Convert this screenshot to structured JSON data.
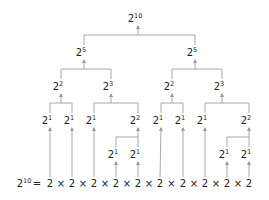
{
  "diagram": {
    "colors": {
      "text": "#222222",
      "line": "#a8a8a8",
      "arrow": "#9a9a9a",
      "background": "#ffffff"
    },
    "nodes": [
      {
        "id": "n0",
        "base": "2",
        "exp": "10",
        "x": 138,
        "y": 22
      },
      {
        "id": "n1",
        "base": "2",
        "exp": "5",
        "x": 84,
        "y": 56
      },
      {
        "id": "n2",
        "base": "2",
        "exp": "5",
        "x": 195,
        "y": 56
      },
      {
        "id": "n3",
        "base": "2",
        "exp": "2",
        "x": 61,
        "y": 90
      },
      {
        "id": "n4",
        "base": "2",
        "exp": "3",
        "x": 111,
        "y": 90
      },
      {
        "id": "n5",
        "base": "2",
        "exp": "2",
        "x": 172,
        "y": 90
      },
      {
        "id": "n6",
        "base": "2",
        "exp": "3",
        "x": 222,
        "y": 90
      },
      {
        "id": "n7",
        "base": "2",
        "exp": "1",
        "x": 50,
        "y": 124
      },
      {
        "id": "n8",
        "base": "2",
        "exp": "1",
        "x": 72,
        "y": 124
      },
      {
        "id": "n9",
        "base": "2",
        "exp": "1",
        "x": 94,
        "y": 124
      },
      {
        "id": "n10",
        "base": "2",
        "exp": "2",
        "x": 138,
        "y": 124
      },
      {
        "id": "n11",
        "base": "2",
        "exp": "1",
        "x": 161,
        "y": 124
      },
      {
        "id": "n12",
        "base": "2",
        "exp": "1",
        "x": 183,
        "y": 124
      },
      {
        "id": "n13",
        "base": "2",
        "exp": "1",
        "x": 205,
        "y": 124
      },
      {
        "id": "n14",
        "base": "2",
        "exp": "2",
        "x": 249,
        "y": 124
      },
      {
        "id": "n15",
        "base": "2",
        "exp": "1",
        "x": 116,
        "y": 158
      },
      {
        "id": "n16",
        "base": "2",
        "exp": "1",
        "x": 138,
        "y": 158
      },
      {
        "id": "n17",
        "base": "2",
        "exp": "1",
        "x": 227,
        "y": 158
      },
      {
        "id": "n18",
        "base": "2",
        "exp": "1",
        "x": 249,
        "y": 158
      }
    ],
    "edges": [
      {
        "parent": "n0",
        "children": [
          "n1",
          "n2"
        ]
      },
      {
        "parent": "n1",
        "children": [
          "n3",
          "n4"
        ]
      },
      {
        "parent": "n2",
        "children": [
          "n5",
          "n6"
        ]
      },
      {
        "parent": "n3",
        "children": [
          "n7",
          "n8"
        ]
      },
      {
        "parent": "n4",
        "children": [
          "n9",
          "n10"
        ]
      },
      {
        "parent": "n5",
        "children": [
          "n11",
          "n12"
        ]
      },
      {
        "parent": "n6",
        "children": [
          "n13",
          "n14"
        ]
      },
      {
        "parent": "n10",
        "children": [
          "n15",
          "n16"
        ]
      },
      {
        "parent": "n14",
        "children": [
          "n17",
          "n18"
        ]
      }
    ],
    "leaf_links": [
      {
        "from": "n7",
        "to_factor": 0
      },
      {
        "from": "n8",
        "to_factor": 1
      },
      {
        "from": "n9",
        "to_factor": 2
      },
      {
        "from": "n15",
        "to_factor": 3
      },
      {
        "from": "n16",
        "to_factor": 4
      },
      {
        "from": "n11",
        "to_factor": 5
      },
      {
        "from": "n12",
        "to_factor": 6
      },
      {
        "from": "n13",
        "to_factor": 7
      },
      {
        "from": "n17",
        "to_factor": 8
      },
      {
        "from": "n18",
        "to_factor": 9
      }
    ],
    "equation": {
      "lhs_base": "2",
      "lhs_exp": "10",
      "equals": "=",
      "factor": "2",
      "times": "×",
      "factor_count": 10,
      "factor_x": [
        50,
        72,
        94,
        116,
        138,
        160,
        183,
        205,
        227,
        249
      ],
      "baseline_y": 187,
      "lhs_x": 24,
      "equals_x": 37
    }
  }
}
